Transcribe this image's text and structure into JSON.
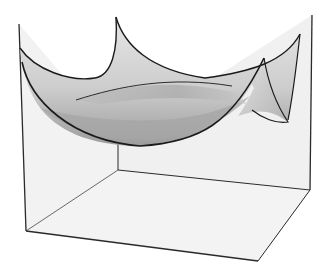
{
  "figure": {
    "type": "3d-surface-in-bounding-box",
    "colors": {
      "background": "#ffffff",
      "box_fill": "#f1f1f1",
      "box_edge": "#2a2a2a",
      "surface_light": "#e2e2e2",
      "surface_mid": "#c4c4c4",
      "surface_dark": "#9a9a9a",
      "surface_edge": "#1a1a1a"
    }
  }
}
